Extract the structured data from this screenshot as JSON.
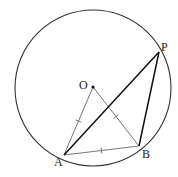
{
  "diagram": {
    "type": "geometry",
    "circle": {
      "center_label": "O",
      "cx": 93,
      "cy": 88,
      "r": 78,
      "stroke": "#333333"
    },
    "points": {
      "O": {
        "label": "O",
        "x": 93,
        "y": 87,
        "label_x": 79,
        "label_y": 89
      },
      "A": {
        "label": "A",
        "x": 64,
        "y": 155,
        "label_x": 54,
        "label_y": 166
      },
      "B": {
        "label": "B",
        "x": 139,
        "y": 146,
        "label_x": 142,
        "label_y": 158
      },
      "P": {
        "label": "P",
        "x": 159,
        "y": 52,
        "label_x": 161,
        "label_y": 51
      }
    },
    "segments": [
      {
        "from": "O",
        "to": "A",
        "weight": "thin",
        "tick": true
      },
      {
        "from": "O",
        "to": "B",
        "weight": "thin",
        "tick": true
      },
      {
        "from": "A",
        "to": "B",
        "weight": "thin",
        "tick": true
      },
      {
        "from": "A",
        "to": "P",
        "weight": "bold",
        "tick": false
      },
      {
        "from": "B",
        "to": "P",
        "weight": "bold",
        "tick": false
      }
    ],
    "colors": {
      "thin": "#666666",
      "bold": "#111111"
    }
  }
}
